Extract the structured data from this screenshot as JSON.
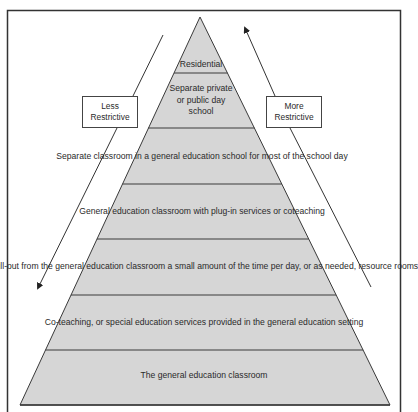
{
  "diagram": {
    "type": "pyramid",
    "colors": {
      "fill": "#d6d6d6",
      "stroke": "#3a3a3a",
      "frame": "#333333",
      "text": "#2a2a2a"
    },
    "layers": [
      {
        "label": "Residential"
      },
      {
        "label": "Separate private\nor public day\nschool"
      },
      {
        "label": "Separate classroom\nin a general education school\nfor most of the school day"
      },
      {
        "label": "General education classroom\nwith plug-in services or coteaching"
      },
      {
        "label": "Pull-out from the general education classroom a\nsmall amount of the time per day, or as needed,\nresource rooms"
      },
      {
        "label": "Co-teaching, or special education services provided\nin the general education setting"
      },
      {
        "label": "The general education classroom"
      }
    ],
    "left_arrow": {
      "label": "Less\nRestrictive",
      "direction": "down"
    },
    "right_arrow": {
      "label": "More\nRestrictive",
      "direction": "up"
    }
  }
}
